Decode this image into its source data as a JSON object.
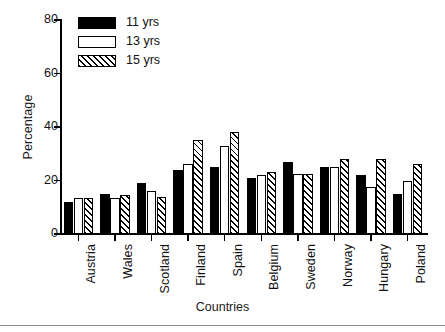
{
  "chart_data": {
    "type": "bar",
    "title": "",
    "xlabel": "Countries",
    "ylabel": "Percentage",
    "ylim": [
      0,
      80
    ],
    "yticks": [
      0,
      20,
      40,
      60,
      80
    ],
    "grid": false,
    "legend_position": "top-left",
    "categories": [
      "Austria",
      "Wales",
      "Scotland",
      "Finland",
      "Spain",
      "Belgium",
      "Sweden",
      "Norway",
      "Hungary",
      "Poland"
    ],
    "series": [
      {
        "name": "11 yrs",
        "fill": "solid",
        "color": "#000000",
        "values": [
          12,
          15,
          19,
          24,
          25,
          21,
          27,
          25,
          22,
          15
        ]
      },
      {
        "name": "13 yrs",
        "fill": "hollow",
        "color": "#ffffff",
        "values": [
          13.5,
          13.5,
          16,
          26,
          33,
          22,
          22.5,
          25,
          17.5,
          20
        ]
      },
      {
        "name": "15 yrs",
        "fill": "hatch",
        "color": "#ffffff",
        "values": [
          13.5,
          14.5,
          14,
          35,
          38,
          23,
          22.5,
          28,
          28,
          26
        ]
      }
    ]
  },
  "axes": {
    "y_title": "Percentage",
    "x_title": "Countries",
    "y_tick_labels": [
      "0",
      "20",
      "40",
      "60",
      "80"
    ]
  },
  "legend": {
    "items": [
      {
        "label": "11 yrs",
        "fill": "solid"
      },
      {
        "label": "13 yrs",
        "fill": "hollow"
      },
      {
        "label": "15 yrs",
        "fill": "hatch"
      }
    ]
  }
}
